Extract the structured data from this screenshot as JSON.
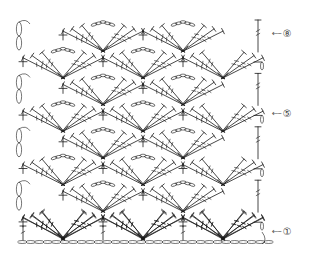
{
  "diagram": {
    "type": "crochet-stitch-chart",
    "colors": {
      "ink": "#1a1a1a",
      "background": "#ffffff",
      "label": "#444444"
    },
    "row_labels": [
      {
        "row": 8,
        "glyph": "⑧",
        "arrow": "←",
        "x": 272,
        "y": 34
      },
      {
        "row": 5,
        "glyph": "⑤",
        "arrow": "←",
        "x": 272,
        "y": 114
      },
      {
        "row": 1,
        "glyph": "①",
        "arrow": "←",
        "x": 272,
        "y": 232
      }
    ],
    "grid": {
      "repeat_width": 80,
      "row_height": 26.7,
      "top_row_y": 35,
      "rows": 8,
      "foundation_y": 242,
      "foundation_x_start": 18,
      "foundation_x_end": 266
    },
    "symbols": {
      "single_crochet": "+",
      "chain": "oval",
      "treble": "T-with-bars",
      "fan": "shell-of-trebles"
    }
  }
}
